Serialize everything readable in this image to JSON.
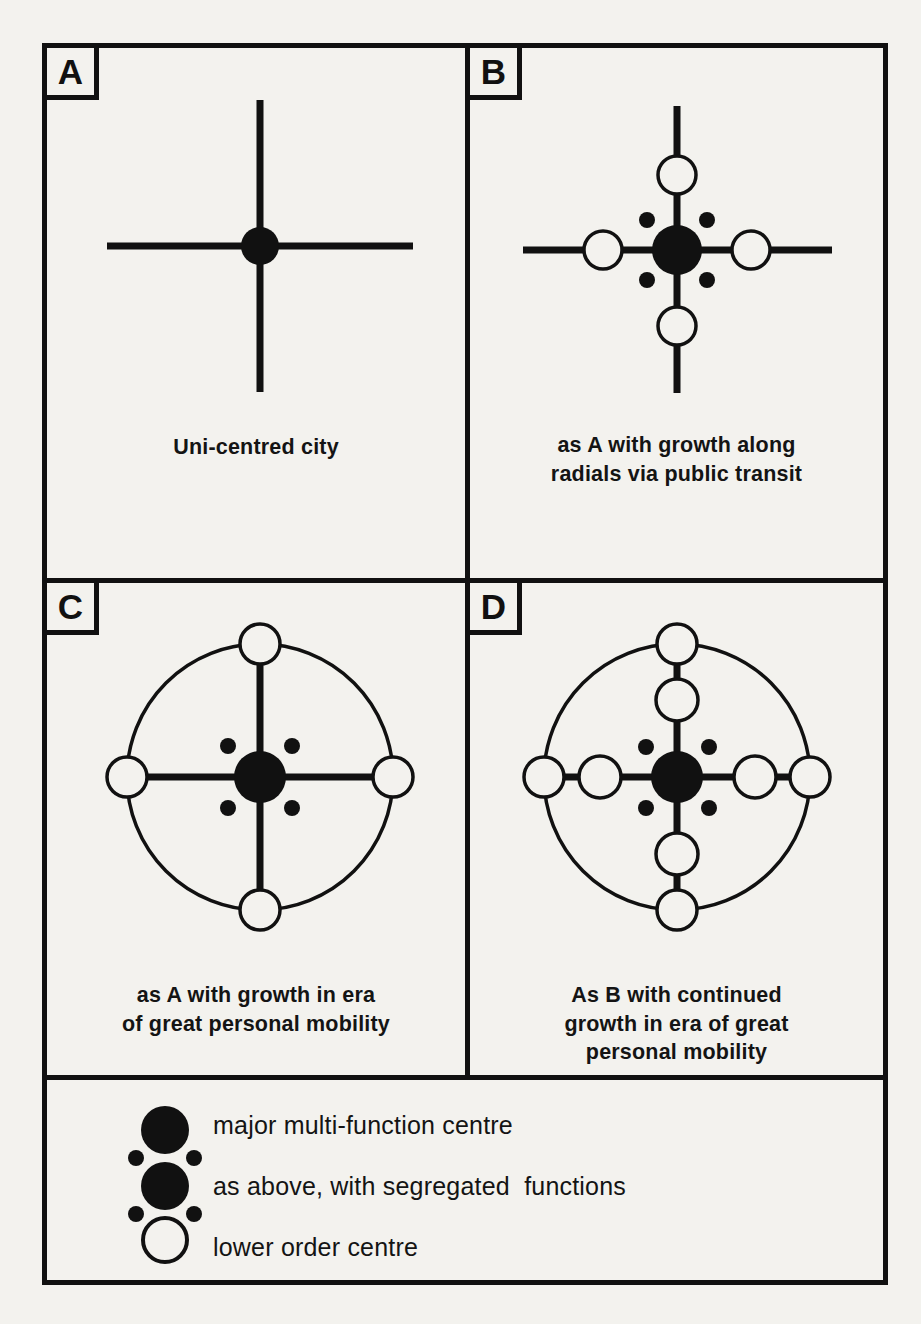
{
  "figure": {
    "type": "diagram",
    "background_color": "#f3f2ee",
    "ink_color": "#111111"
  },
  "panels": [
    {
      "letter": "A",
      "caption": "Uni-centred city",
      "caption_lines": [
        "Uni-centred city"
      ],
      "features": {
        "radials": true,
        "ring_road": false,
        "major_centre": true,
        "segregated_dots": false,
        "lower_order_on_radials": 0,
        "lower_order_on_ring": 0
      }
    },
    {
      "letter": "B",
      "caption": "as A with growth along radials via public transit",
      "caption_lines": [
        "as A with growth along",
        "radials via public transit"
      ],
      "features": {
        "radials": true,
        "ring_road": false,
        "major_centre": true,
        "segregated_dots": true,
        "lower_order_on_radials": 4,
        "lower_order_on_ring": 0
      }
    },
    {
      "letter": "C",
      "caption": "as A with growth in era of great personal mobility",
      "caption_lines": [
        "as A with growth in era",
        "of great personal mobility"
      ],
      "features": {
        "radials": true,
        "ring_road": true,
        "major_centre": true,
        "segregated_dots": true,
        "lower_order_on_radials": 0,
        "lower_order_on_ring": 4
      }
    },
    {
      "letter": "D",
      "caption": "As B with continued growth in era of great personal mobility",
      "caption_lines": [
        "As B with continued",
        "growth in era of great",
        "personal mobility"
      ],
      "features": {
        "radials": true,
        "ring_road": true,
        "major_centre": true,
        "segregated_dots": true,
        "lower_order_on_radials": 4,
        "lower_order_on_ring": 4
      }
    }
  ],
  "legend": {
    "items": [
      {
        "symbol": "filled-large-circle",
        "label": "major multi-function centre"
      },
      {
        "symbol": "filled-large-circle-with-four-small-dots",
        "label": "as above, with segregated  functions"
      },
      {
        "symbol": "open-circle",
        "label": "lower order centre"
      }
    ]
  }
}
